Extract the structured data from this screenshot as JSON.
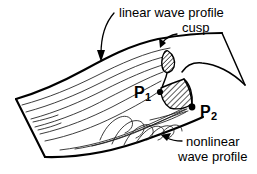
{
  "figure": {
    "background_color": "#ffffff",
    "ink_color": "#000000",
    "annotations": {
      "linear_label": "linear wave profile",
      "cusp_label": "cusp",
      "nonlinear_label_line1": "nonlinear",
      "nonlinear_label_line2": "wave profile"
    },
    "points": [
      {
        "name": "P1",
        "letter": "P",
        "subscript": "1"
      },
      {
        "name": "P2",
        "letter": "P",
        "subscript": "2"
      }
    ],
    "regions": {
      "cusp_small_name": "cusp-tip-hatched-lobe",
      "cusp_large_name": "cusp-hatched-triangle"
    }
  }
}
